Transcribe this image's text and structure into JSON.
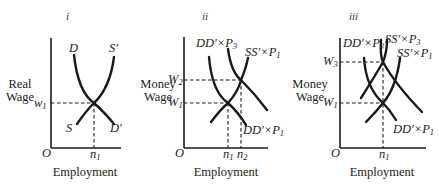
{
  "panels": [
    {
      "id": "i",
      "numeral": "i",
      "ylabel_line1": "Real",
      "ylabel_line2": "Wage",
      "xlabel": "Employment",
      "origin": "O",
      "curves": {
        "demand_top": "D",
        "demand_bottom": "D′",
        "supply_top": "S′",
        "supply_bottom": "S"
      },
      "wage_labels": [
        {
          "base": "w",
          "sub": "1"
        }
      ],
      "employment_labels": [
        {
          "base": "n",
          "sub": "1"
        }
      ]
    },
    {
      "id": "ii",
      "numeral": "ii",
      "ylabel_line1": "Money",
      "ylabel_line2": "Wage",
      "xlabel": "Employment",
      "origin": "O",
      "curves": {
        "demand_high": {
          "base": "DD′×P",
          "sub": "3"
        },
        "demand_low": {
          "base": "DD′×P",
          "sub": "1"
        },
        "supply": {
          "base": "SS′×P",
          "sub": "1"
        }
      },
      "wage_labels": [
        {
          "base": "W",
          "sub": "2"
        },
        {
          "base": "W",
          "sub": "1"
        }
      ],
      "employment_labels": [
        {
          "base": "n",
          "sub": "1"
        },
        {
          "base": "n",
          "sub": "2"
        }
      ]
    },
    {
      "id": "iii",
      "numeral": "iii",
      "ylabel_line1": "Money",
      "ylabel_line2": "Wage",
      "xlabel": "Employment",
      "origin": "O",
      "curves": {
        "demand_high": {
          "base": "DD′×P",
          "sub": "3"
        },
        "demand_low": {
          "base": "DD′×P",
          "sub": "1"
        },
        "supply_high": {
          "base": "SS′×P",
          "sub": "3"
        },
        "supply_low": {
          "base": "SS′×P",
          "sub": "1"
        }
      },
      "wage_labels": [
        {
          "base": "W",
          "sub": "3"
        },
        {
          "base": "W",
          "sub": "1"
        }
      ],
      "employment_labels": [
        {
          "base": "n",
          "sub": "1"
        }
      ]
    }
  ]
}
